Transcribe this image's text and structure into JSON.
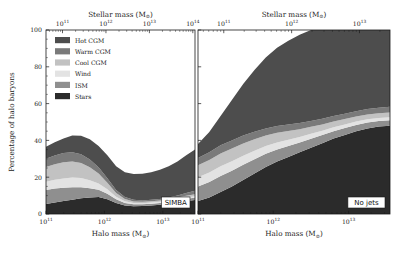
{
  "figure": {
    "type": "stacked-area-pair",
    "background": "#ffffff",
    "width": 401,
    "height": 258
  },
  "axes": {
    "y_label": "Percentage of halo baryons",
    "y_ticks": [
      0,
      20,
      40,
      60,
      80,
      100
    ],
    "y_tick_labels": [
      "0",
      "20",
      "40",
      "60",
      "80",
      "100"
    ],
    "ylim": [
      0,
      100
    ],
    "x_bottom_label": "Halo mass (M",
    "x_bottom_label_sub": "⊙",
    "x_bottom_label_end": ")",
    "x_top_label": "Stellar mass (M",
    "x_top_label_sub": "⊙",
    "x_top_label_end": ")",
    "x_tick_mantissa": "10",
    "grid": false
  },
  "legend": {
    "position": "upper-left",
    "entries": [
      {
        "label": "Hot CGM",
        "color": "#4d4d4d"
      },
      {
        "label": "Warm CGM",
        "color": "#7a7a7a"
      },
      {
        "label": "Cool CGM",
        "color": "#c2c2c2"
      },
      {
        "label": "Wind",
        "color": "#e3e3e3"
      },
      {
        "label": "ISM",
        "color": "#8f8f8f"
      },
      {
        "label": "Stars",
        "color": "#2b2b2b"
      }
    ]
  },
  "panels": [
    {
      "id": "simba",
      "tag": "SIMBA",
      "tag_position": "bottom-right",
      "x_bottom_ticks": [
        11,
        12,
        13
      ],
      "x_bottom_tick_exponents": [
        "11",
        "12",
        "13"
      ],
      "x_bottom_range": [
        11.0,
        13.55
      ],
      "x_top_ticks": [
        11,
        12,
        13,
        14
      ],
      "x_top_tick_exponents": [
        "11",
        "12",
        "13",
        "14"
      ],
      "x_top_range": [
        10.62,
        14.05
      ]
    },
    {
      "id": "no-jets",
      "tag": "No jets",
      "tag_position": "bottom-right",
      "x_bottom_ticks": [
        11,
        12,
        13
      ],
      "x_bottom_tick_exponents": [
        "11",
        "12",
        "13"
      ],
      "x_bottom_range": [
        11.0,
        13.55
      ],
      "x_top_ticks": [
        11,
        12,
        13
      ],
      "x_top_tick_exponents": [
        "11",
        "12",
        "13"
      ],
      "x_top_range": [
        10.62,
        13.45
      ]
    }
  ],
  "chart_data": {
    "type": "area",
    "title": "",
    "subtitle": "",
    "xlabel": "Halo mass (M⊙)",
    "ylabel": "Percentage of halo baryons",
    "xlabel_top": "Stellar mass (M⊙)",
    "xscale": "log10",
    "ylim": [
      0,
      100
    ],
    "stack_order_bottom_to_top": [
      "Stars",
      "ISM",
      "Wind",
      "Cool CGM",
      "Warm CGM",
      "Hot CGM"
    ],
    "legend": [
      "Hot CGM",
      "Warm CGM",
      "Cool CGM",
      "Wind",
      "ISM",
      "Stars"
    ],
    "panels": [
      {
        "name": "SIMBA",
        "x": [
          11.0,
          11.15,
          11.3,
          11.45,
          11.6,
          11.75,
          11.9,
          12.05,
          12.2,
          12.35,
          12.5,
          12.65,
          12.8,
          12.95,
          13.1,
          13.25,
          13.4,
          13.55
        ],
        "series": [
          {
            "name": "Stars",
            "values": [
              5.5,
              6.2,
              7.0,
              7.8,
              8.5,
              9.0,
              9.2,
              8.0,
              6.0,
              4.6,
              4.2,
              4.3,
              4.6,
              5.0,
              5.6,
              6.3,
              7.0,
              7.6
            ]
          },
          {
            "name": "ISM",
            "values": [
              7.5,
              7.6,
              7.3,
              6.8,
              6.0,
              5.0,
              4.0,
              3.0,
              2.0,
              1.4,
              1.1,
              1.0,
              1.0,
              1.0,
              1.0,
              1.1,
              1.2,
              1.3
            ]
          },
          {
            "name": "Wind",
            "values": [
              4.5,
              4.8,
              5.0,
              5.2,
              5.0,
              4.4,
              3.4,
              2.4,
              1.4,
              0.9,
              0.7,
              0.6,
              0.6,
              0.6,
              0.6,
              0.6,
              0.7,
              0.8
            ]
          },
          {
            "name": "Cool CGM",
            "values": [
              8.0,
              8.4,
              8.8,
              8.8,
              8.2,
              7.0,
              5.4,
              3.6,
              2.0,
              1.2,
              0.8,
              0.7,
              0.7,
              0.7,
              0.8,
              0.9,
              1.0,
              1.1
            ]
          },
          {
            "name": "Warm CGM",
            "values": [
              4.5,
              4.8,
              5.0,
              5.0,
              4.8,
              4.2,
              3.4,
              2.4,
              1.6,
              1.1,
              0.9,
              0.8,
              0.8,
              0.9,
              1.0,
              1.2,
              1.5,
              1.8
            ]
          },
          {
            "name": "Hot CGM",
            "values": [
              6.5,
              7.2,
              8.0,
              9.0,
              10.0,
              11.0,
              11.5,
              12.5,
              13.0,
              13.5,
              14.0,
              14.5,
              15.0,
              15.8,
              17.0,
              18.5,
              20.5,
              22.5
            ]
          }
        ],
        "totals": [
          36.5,
          39.0,
          41.1,
          42.6,
          42.5,
          40.6,
          36.9,
          31.9,
          26.0,
          22.7,
          21.7,
          21.9,
          22.7,
          24.0,
          26.0,
          28.6,
          31.9,
          35.1
        ]
      },
      {
        "name": "No jets",
        "x": [
          11.0,
          11.15,
          11.3,
          11.45,
          11.6,
          11.75,
          11.9,
          12.05,
          12.2,
          12.35,
          12.5,
          12.65,
          12.8,
          12.95,
          13.1,
          13.25,
          13.4,
          13.55
        ],
        "series": [
          {
            "name": "Stars",
            "values": [
              7.0,
              9.0,
              12.0,
              15.0,
              18.5,
              22.0,
              25.5,
              28.5,
              31.0,
              33.5,
              36.0,
              38.5,
              41.0,
              43.0,
              45.0,
              46.5,
              47.5,
              48.0
            ]
          },
          {
            "name": "ISM",
            "values": [
              8.0,
              8.4,
              8.6,
              8.5,
              8.2,
              7.8,
              7.2,
              6.6,
              6.0,
              5.4,
              4.9,
              4.4,
              4.0,
              3.7,
              3.4,
              3.2,
              3.0,
              2.9
            ]
          },
          {
            "name": "Wind",
            "values": [
              5.0,
              5.2,
              5.3,
              5.2,
              5.0,
              4.6,
              4.2,
              3.8,
              3.4,
              3.0,
              2.7,
              2.4,
              2.2,
              2.0,
              1.9,
              1.8,
              1.7,
              1.7
            ]
          },
          {
            "name": "Cool CGM",
            "values": [
              6.5,
              6.8,
              7.0,
              6.9,
              6.6,
              6.2,
              5.7,
              5.2,
              4.7,
              4.2,
              3.8,
              3.4,
              3.1,
              2.9,
              2.7,
              2.6,
              2.5,
              2.5
            ]
          },
          {
            "name": "Warm CGM",
            "values": [
              4.0,
              4.2,
              4.4,
              4.4,
              4.3,
              4.1,
              3.9,
              3.7,
              3.5,
              3.3,
              3.1,
              3.0,
              2.9,
              2.9,
              2.9,
              3.0,
              3.1,
              3.2
            ]
          },
          {
            "name": "Hot CGM",
            "values": [
              7.5,
              11.0,
              16.0,
              22.0,
              28.0,
              33.5,
              38.5,
              42.5,
              45.5,
              48.0,
              49.5,
              48.3,
              46.8,
              45.5,
              44.1,
              42.9,
              42.2,
              41.7
            ]
          }
        ],
        "totals": [
          38.0,
          44.6,
          53.3,
          62.0,
          70.6,
          78.2,
          85.0,
          90.3,
          94.1,
          97.4,
          100.0,
          100.0,
          100.0,
          100.0,
          100.0,
          100.0,
          100.0,
          100.0
        ]
      }
    ]
  }
}
